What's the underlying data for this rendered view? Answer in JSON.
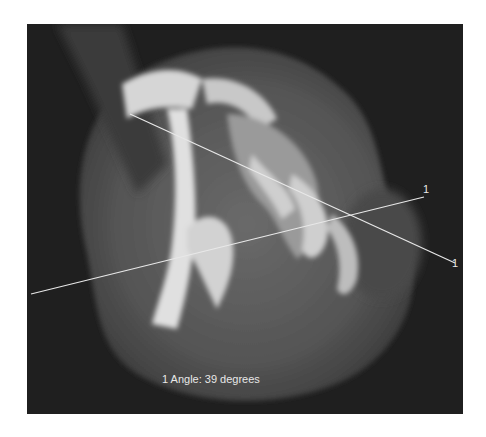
{
  "image": {
    "type": "CT axial scan",
    "colors": {
      "background": "#ffffff",
      "scan_background": "#1f1f1f",
      "overlay": "#e8e8e8"
    }
  },
  "measurement": {
    "readout": "1 Angle: 39 degrees",
    "angle_id": "1",
    "angle_value": 39,
    "angle_unit": "degrees",
    "line_a": {
      "label": "1",
      "x1": 4,
      "y1": 270,
      "x2": 397,
      "y2": 173
    },
    "line_b": {
      "label": "1",
      "x1": 103,
      "y1": 90,
      "x2": 428,
      "y2": 239
    }
  }
}
